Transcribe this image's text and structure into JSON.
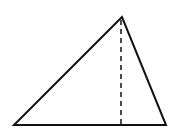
{
  "diagram": {
    "type": "triangle-with-altitude",
    "background": "#ffffff",
    "stroke_color": "#111111",
    "vertices": {
      "apex": [
        122,
        17
      ],
      "base_left": [
        14,
        125
      ],
      "base_right": [
        166,
        125
      ]
    },
    "altitude": {
      "from": [
        121,
        19
      ],
      "to": [
        121,
        125
      ],
      "style": "dashed"
    }
  }
}
